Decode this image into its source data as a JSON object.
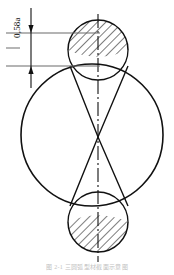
{
  "figure": {
    "kind": "engineering-line-drawing",
    "background_color": "#ffffff",
    "line_color": "#111111",
    "extension_line_color": "#5a5a5a",
    "canvas": {
      "width": 174,
      "height": 275
    },
    "dimension": {
      "label": "0,58a",
      "label_number": "0,58",
      "label_symbol": "a",
      "orientation": "vertical",
      "arrow_top_y": 33,
      "arrow_bottom_y": 66,
      "dimension_line_x": 31
    },
    "centerline": {
      "style": "dash-dot",
      "x": 98,
      "top_y": 14,
      "bottom_y": 262
    },
    "main_circle": {
      "center_x": 92,
      "center_y": 135,
      "radius": 71,
      "left_x": 27,
      "right_x": 158,
      "top_y": 64,
      "bottom_y": 206
    },
    "top_lobe": {
      "name": "top-hatched-segment",
      "center_x": 98,
      "center_y": 50,
      "radius": 30,
      "hatched": true,
      "hatch_angle_deg": 45
    },
    "bottom_lobe": {
      "name": "bottom-hatched-segment",
      "center_x": 98,
      "center_y": 222,
      "radius": 30,
      "hatched": true,
      "hatch_angle_deg": 45
    },
    "bowtie": {
      "name": "two-triangles-meeting-at-center",
      "apex_x": 98,
      "apex_y": 137,
      "upper_left_x": 70,
      "upper_right_x": 128,
      "upper_y": 66,
      "lower_left_x": 70,
      "lower_right_x": 128,
      "lower_y": 206
    },
    "caption": "图 2-1  三圆弧型材截面示意图"
  }
}
